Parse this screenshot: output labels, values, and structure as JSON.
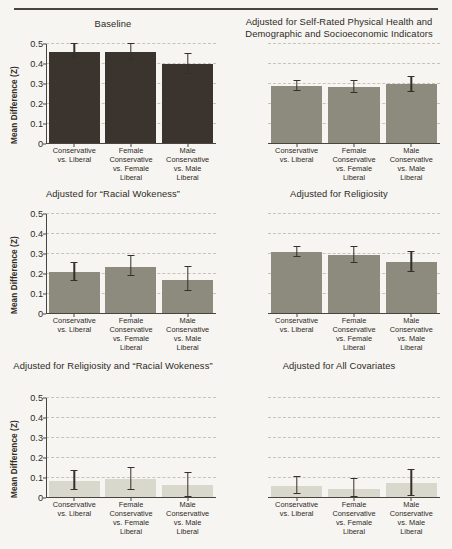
{
  "figure": {
    "yaxis_title": "Mean Difference (Z)",
    "ytick_labels": [
      "0.5",
      "0.4",
      "0.3",
      "0.2",
      "0.1",
      "0"
    ],
    "categories": [
      [
        "Conservative",
        "vs. Liberal"
      ],
      [
        "Female",
        "Conservative",
        "vs. Female",
        "Liberal"
      ],
      [
        "Male",
        "Conservative",
        "vs. Male",
        "Liberal"
      ]
    ],
    "colors": {
      "background": "#f6f5f1",
      "bar_dark": "#3a332e",
      "bar_medium": "#8d8b7e",
      "bar_light": "#d9d8cd",
      "axis": "#4a443e",
      "gridline": "#c7c4b6"
    }
  },
  "chart_data": [
    {
      "type": "bar",
      "title": "Baseline",
      "panel": "top-left",
      "xlabel": "",
      "ylabel": "Mean Difference (Z)",
      "ylim": [
        0,
        0.5
      ],
      "yticks": [
        0,
        0.1,
        0.2,
        0.3,
        0.4,
        0.5
      ],
      "grid": true,
      "show_yaxis": true,
      "bar_color": "#3a332e",
      "categories": [
        "Conservative vs. Liberal",
        "Female Conservative vs. Female Liberal",
        "Male Conservative vs. Male Liberal"
      ],
      "values": [
        0.46,
        0.46,
        0.4
      ],
      "err_low": [
        0.43,
        0.42,
        0.35
      ],
      "err_high": [
        0.5,
        0.5,
        0.45
      ]
    },
    {
      "type": "bar",
      "title": "Adjusted for Self-Rated Physical Health and Demographic and Socioeconomic Indicators",
      "panel": "top-right",
      "xlabel": "",
      "ylabel": "",
      "ylim": [
        0,
        0.5
      ],
      "yticks": [
        0,
        0.1,
        0.2,
        0.3,
        0.4,
        0.5
      ],
      "grid": true,
      "show_yaxis": false,
      "bar_color": "#8d8b7e",
      "categories": [
        "Conservative vs. Liberal",
        "Female Conservative vs. Female Liberal",
        "Male Conservative vs. Male Liberal"
      ],
      "values": [
        0.29,
        0.285,
        0.3
      ],
      "err_low": [
        0.265,
        0.255,
        0.26
      ],
      "err_high": [
        0.315,
        0.315,
        0.335
      ]
    },
    {
      "type": "bar",
      "title": "Adjusted for “Racial Wokeness”",
      "panel": "middle-left",
      "xlabel": "",
      "ylabel": "Mean Difference (Z)",
      "ylim": [
        0,
        0.5
      ],
      "yticks": [
        0,
        0.1,
        0.2,
        0.3,
        0.4,
        0.5
      ],
      "grid": true,
      "show_yaxis": true,
      "bar_color": "#8d8b7e",
      "categories": [
        "Conservative vs. Liberal",
        "Female Conservative vs. Female Liberal",
        "Male Conservative vs. Male Liberal"
      ],
      "values": [
        0.21,
        0.235,
        0.17
      ],
      "err_low": [
        0.165,
        0.19,
        0.115
      ],
      "err_high": [
        0.255,
        0.29,
        0.235
      ]
    },
    {
      "type": "bar",
      "title": "Adjusted for Religiosity",
      "panel": "middle-right",
      "xlabel": "",
      "ylabel": "",
      "ylim": [
        0,
        0.5
      ],
      "yticks": [
        0,
        0.1,
        0.2,
        0.3,
        0.4,
        0.5
      ],
      "grid": true,
      "show_yaxis": false,
      "bar_color": "#8d8b7e",
      "categories": [
        "Conservative vs. Liberal",
        "Female Conservative vs. Female Liberal",
        "Male Conservative vs. Male Liberal"
      ],
      "values": [
        0.31,
        0.295,
        0.26
      ],
      "err_low": [
        0.285,
        0.255,
        0.21
      ],
      "err_high": [
        0.335,
        0.335,
        0.31
      ]
    },
    {
      "type": "bar",
      "title": "Adjusted for Religiosity and “Racial Wokeness”",
      "panel": "bottom-left",
      "xlabel": "",
      "ylabel": "Mean Difference (Z)",
      "ylim": [
        0,
        0.5
      ],
      "yticks": [
        0,
        0.1,
        0.2,
        0.3,
        0.4,
        0.5
      ],
      "grid": true,
      "show_yaxis": true,
      "bar_color": "#d9d8cd",
      "categories": [
        "Conservative vs. Liberal",
        "Female Conservative vs. Female Liberal",
        "Male Conservative vs. Male Liberal"
      ],
      "values": [
        0.085,
        0.095,
        0.065
      ],
      "err_low": [
        0.04,
        0.04,
        0.005
      ],
      "err_high": [
        0.135,
        0.15,
        0.125
      ]
    },
    {
      "type": "bar",
      "title": "Adjusted for All Covariates",
      "panel": "bottom-right",
      "xlabel": "",
      "ylabel": "",
      "ylim": [
        0,
        0.5
      ],
      "yticks": [
        0,
        0.1,
        0.2,
        0.3,
        0.4,
        0.5
      ],
      "grid": true,
      "show_yaxis": false,
      "bar_color": "#d9d8cd",
      "categories": [
        "Conservative vs. Liberal",
        "Female Conservative vs. Female Liberal",
        "Male Conservative vs. Male Liberal"
      ],
      "values": [
        0.06,
        0.045,
        0.075
      ],
      "err_low": [
        0.02,
        0.005,
        0.01
      ],
      "err_high": [
        0.105,
        0.095,
        0.14
      ]
    }
  ]
}
